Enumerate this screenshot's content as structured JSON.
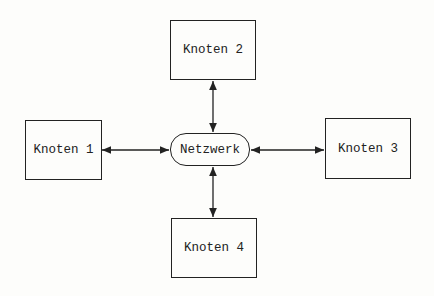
{
  "diagram": {
    "center": {
      "label": "Netzwerk"
    },
    "nodes": [
      {
        "id": "node-1",
        "label": "Knoten 1"
      },
      {
        "id": "node-2",
        "label": "Knoten 2"
      },
      {
        "id": "node-3",
        "label": "Knoten 3"
      },
      {
        "id": "node-4",
        "label": "Knoten 4"
      }
    ],
    "edges": [
      {
        "from": "Knoten 1",
        "to": "Netzwerk",
        "bidirectional": true
      },
      {
        "from": "Knoten 2",
        "to": "Netzwerk",
        "bidirectional": true
      },
      {
        "from": "Knoten 3",
        "to": "Netzwerk",
        "bidirectional": true
      },
      {
        "from": "Knoten 4",
        "to": "Netzwerk",
        "bidirectional": true
      }
    ],
    "line_color": "#222222"
  }
}
